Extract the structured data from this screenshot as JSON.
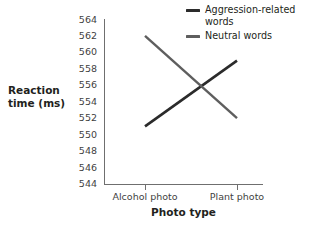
{
  "chart_data": {
    "type": "line",
    "title": "",
    "xlabel": "Photo type",
    "ylabel": "Reaction time (ms)",
    "categories": [
      "Alcohol photo",
      "Plant photo"
    ],
    "ylim": [
      544,
      564
    ],
    "ytick_step": 2,
    "yticks": [
      564,
      562,
      560,
      558,
      556,
      554,
      552,
      550,
      548,
      546,
      544
    ],
    "grid": false,
    "legend_position": "top-right",
    "series": [
      {
        "name": "Aggression-related words",
        "values": [
          551,
          559
        ],
        "color": "#2b2b2b"
      },
      {
        "name": "Neutral words",
        "values": [
          562,
          552
        ],
        "color": "#5e5e5e"
      }
    ]
  },
  "axis": {
    "y_title_line1": "Reaction",
    "y_title_line2": "time (ms)",
    "x_title": "Photo type"
  },
  "legend": {
    "items": [
      {
        "label": "Aggression-related words",
        "color": "#2b2b2b"
      },
      {
        "label": "Neutral words",
        "color": "#5e5e5e"
      }
    ]
  },
  "colors": {
    "axis": "#6f6f6f",
    "tick_text": "#3f3f3f",
    "title_text": "#231f20",
    "background": "#ffffff"
  }
}
